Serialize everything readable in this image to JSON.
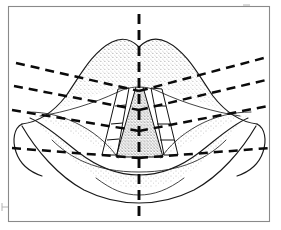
{
  "figure": {
    "background_color": "#ffffff",
    "ink_color": "#111111",
    "frame_color": "#8a8a8a",
    "stipple_color": "#6f6f6f",
    "canvas": {
      "width": 281,
      "height": 230
    }
  },
  "frame": {
    "name": "image-border",
    "x": 8,
    "y": 6,
    "width": 262,
    "height": 216,
    "stroke_width": 1.1
  },
  "marks": {
    "bottom_left_tick": {
      "x": 2,
      "y": 203,
      "length": 8
    },
    "top_right_tick": {
      "x": 243,
      "y": 5,
      "length": 7
    }
  },
  "midline": {
    "name": "vertical-midline",
    "label": "midline",
    "x": 139,
    "y_top": 14,
    "y_bottom": 220,
    "dash": "10 6",
    "stroke_width": 2.9,
    "color": "#0b0b0b"
  },
  "guide_lines": [
    {
      "id": "guide-1",
      "label": "upper-oblique-left",
      "side": "left",
      "x1": 16,
      "y1": 63,
      "x2": 139,
      "y2": 91
    },
    {
      "id": "guide-2",
      "label": "upper-oblique-right",
      "side": "right",
      "x1": 139,
      "y1": 91,
      "x2": 264,
      "y2": 58
    },
    {
      "id": "guide-3",
      "label": "mid-oblique-left",
      "side": "left",
      "x1": 14,
      "y1": 86,
      "x2": 139,
      "y2": 110
    },
    {
      "id": "guide-4",
      "label": "mid-oblique-right",
      "side": "right",
      "x1": 139,
      "y1": 110,
      "x2": 266,
      "y2": 80
    },
    {
      "id": "guide-5",
      "label": "lower-oblique-left",
      "side": "left",
      "x1": 12,
      "y1": 110,
      "x2": 139,
      "y2": 131
    },
    {
      "id": "guide-6",
      "label": "lower-oblique-right",
      "side": "right",
      "x1": 139,
      "y1": 131,
      "x2": 268,
      "y2": 106
    },
    {
      "id": "guide-7",
      "label": "basal-oblique-left",
      "side": "left",
      "x1": 12,
      "y1": 148,
      "x2": 139,
      "y2": 158
    },
    {
      "id": "guide-8",
      "label": "basal-oblique-right",
      "side": "right",
      "x1": 139,
      "y1": 158,
      "x2": 270,
      "y2": 148
    }
  ],
  "flaps": {
    "left": {
      "name": "left-flap-column",
      "segments": 4,
      "outer_path": "M 118 89 L 102 155",
      "inner_path": "M 129 88 L 117 155",
      "rungs": [
        "M 118 89 L 129 88",
        "M 115 106 L 126 105",
        "M 111 124 L 123 123",
        "M 107 140 L 119 139",
        "M 102 155 L 117 155"
      ]
    },
    "right": {
      "name": "right-flap-column",
      "segments": 4,
      "outer_path": "M 162 89 L 178 155",
      "inner_path": "M 151 88 L 164 155",
      "rungs": [
        "M 151 88 L 162 89",
        "M 154 106 L 166 106",
        "M 157 124 L 170 124",
        "M 160 140 L 174 140",
        "M 164 155 L 178 155"
      ]
    }
  },
  "central_segment": {
    "name": "philtral-triangle",
    "label": "central-triangular-flap",
    "path": "M 136 87 L 143 87 L 163 157 L 116 157 Z",
    "shading": "stippled"
  },
  "anatomy": {
    "upper_lip": {
      "name": "upper-lip-outline",
      "vermilion_border": "M 22 124 C 38 122 52 114 66 96 C 80 76 92 52 112 42 C 124 36 132 40 139 47 C 146 40 155 36 167 42 C 187 52 199 76 213 96 C 227 114 241 122 257 124",
      "wet_line": "M 40 116 C 66 112 92 104 118 92 C 126 88 133 87 139 87 C 145 87 152 88 160 92 C 186 104 214 112 240 116"
    },
    "lower_lip": {
      "name": "lower-lip-outline",
      "upper_edge": "M 30 118 C 48 126 62 140 78 152 C 96 166 116 175 139 175 C 162 175 182 166 200 152 C 216 140 230 126 248 118",
      "lower_edge": "M 22 126 C 36 150 58 176 84 190 C 102 199 120 203 139 203 C 158 203 176 199 194 190 C 220 176 242 150 256 126",
      "inner_crease": "M 52 140 C 70 158 96 172 139 172 C 182 172 208 158 226 140"
    },
    "commissure_left": {
      "name": "left-commissure",
      "path": "M 22 124 C 14 128 12 140 16 152 C 20 164 30 172 42 176"
    },
    "commissure_right": {
      "name": "right-commissure",
      "path": "M 257 124 C 265 128 267 140 263 152 C 259 164 249 172 237 176"
    },
    "left_cheek_wing": {
      "name": "left-cheek-contour",
      "path": "M 28 112 C 46 112 64 116 82 126 C 98 135 110 146 118 158"
    },
    "right_cheek_wing": {
      "name": "right-cheek-contour",
      "path": "M 251 112 C 233 112 215 116 197 126 C 181 135 169 146 161 158"
    }
  }
}
